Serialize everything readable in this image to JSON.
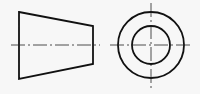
{
  "diagram": {
    "views": [
      {
        "name": "front-view",
        "shape": "trapezoid",
        "points": [
          [
            19,
            12
          ],
          [
            93,
            26
          ],
          [
            93,
            64
          ],
          [
            19,
            79
          ]
        ],
        "centerline_y": 45,
        "centerline_x": [
          11,
          100
        ]
      },
      {
        "name": "side-view",
        "shape": "concentric-circles",
        "center": [
          151,
          45
        ],
        "outer_radius": 33,
        "inner_radius": 19,
        "centerline_h": [
          110,
          191
        ],
        "centerline_v": [
          3,
          88
        ]
      }
    ],
    "colors": {
      "stroke": "#111111",
      "background": "#f7f7f7"
    }
  }
}
